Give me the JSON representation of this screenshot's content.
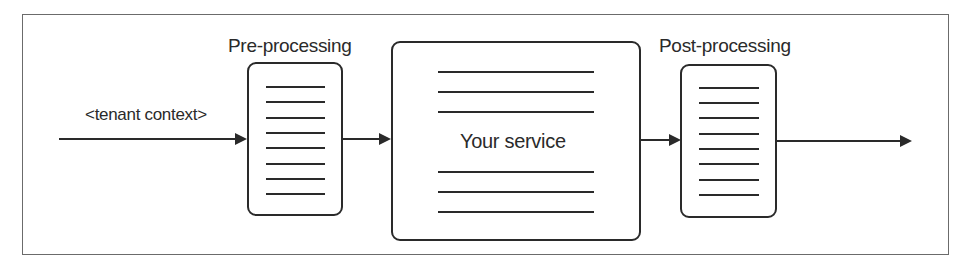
{
  "diagram": {
    "input_label": "<tenant context>",
    "pre": {
      "title": "Pre-processing",
      "line_count": 8
    },
    "service": {
      "title": "Your service",
      "top_lines": 3,
      "bottom_lines": 3
    },
    "post": {
      "title": "Post-processing",
      "line_count": 8
    },
    "colors": {
      "stroke": "#2a2a2a",
      "frame": "#6b6b6b",
      "background": "#ffffff"
    }
  }
}
